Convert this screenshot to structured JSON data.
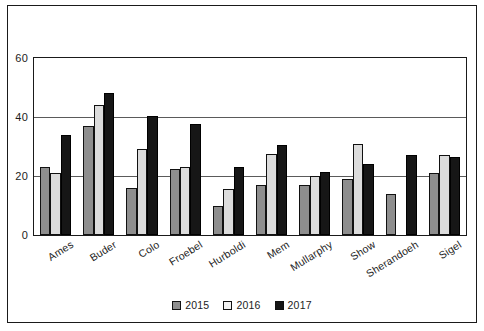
{
  "chart_data": {
    "type": "bar",
    "title": "",
    "xlabel": "",
    "ylabel": "",
    "ylim": [
      0,
      60
    ],
    "yticks": [
      0,
      20,
      40,
      60
    ],
    "grid": true,
    "legend_position": "bottom",
    "categories": [
      "Ames",
      "Buder",
      "Colo",
      "Froebel",
      "Hurboldi",
      "Mem",
      "Mullarphy",
      "Show",
      "Sherandoeh",
      "Sigel"
    ],
    "series": [
      {
        "name": "2015",
        "color": "#8e8e8e",
        "values": [
          23,
          37,
          16,
          22.5,
          10,
          17,
          17,
          19,
          14,
          21
        ]
      },
      {
        "name": "2016",
        "color": "#dcdcdc",
        "values": [
          21,
          44,
          29,
          23,
          15.5,
          27.5,
          20,
          31,
          0,
          27
        ]
      },
      {
        "name": "2017",
        "color": "#161616",
        "values": [
          34,
          48,
          40.5,
          37.5,
          23,
          30.5,
          21.5,
          24,
          27,
          26.5
        ]
      }
    ]
  },
  "axis": {
    "ytick_labels": [
      "0",
      "20",
      "40",
      "60"
    ]
  },
  "legend": {
    "items": [
      {
        "label": "2015",
        "swatch": "legend-swatch-2015"
      },
      {
        "label": "2016",
        "swatch": "legend-swatch-2016"
      },
      {
        "label": "2017",
        "swatch": "legend-swatch-2017"
      }
    ]
  }
}
